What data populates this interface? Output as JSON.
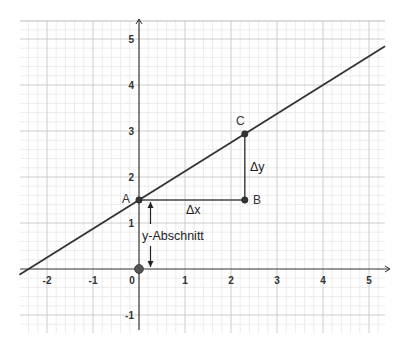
{
  "chart_data": {
    "type": "line",
    "title": "",
    "xlabel": "",
    "ylabel": "",
    "xlim": [
      -2.6,
      5.35
    ],
    "ylim": [
      -1.4,
      5.4
    ],
    "grid": true,
    "minor_grid_divisions": 5,
    "x_ticks": [
      -2,
      -1,
      0,
      1,
      2,
      3,
      4,
      5
    ],
    "y_ticks": [
      -1,
      1,
      2,
      3,
      4,
      5
    ],
    "x_tick_labels": [
      "-2",
      "-1",
      "0",
      "1",
      "2",
      "3",
      "4",
      "5"
    ],
    "y_tick_labels": [
      "-1",
      "1",
      "2",
      "3",
      "4",
      "5"
    ],
    "line": {
      "slope": 0.625,
      "intercept": 1.5,
      "color": "#333333"
    },
    "points": [
      {
        "name": "A",
        "x": 0,
        "y": 1.5
      },
      {
        "name": "B",
        "x": 2.3,
        "y": 1.5
      },
      {
        "name": "C",
        "x": 2.3,
        "y": 2.9375
      },
      {
        "name": "",
        "x": 0,
        "y": 0
      }
    ],
    "segments": [
      {
        "from": "A",
        "to": "B",
        "label": "Δx"
      },
      {
        "from": "B",
        "to": "C",
        "label": "Δy"
      }
    ],
    "annotations": [
      {
        "text": "y-Abschnitt",
        "type": "double-arrow",
        "from": [
          0.25,
          0
        ],
        "to": [
          0.25,
          1.5
        ]
      }
    ],
    "colors": {
      "axis": "#333333",
      "major_grid": "#cccccc",
      "minor_grid": "#ececec",
      "point": "#333333",
      "origin_point": "#555555"
    }
  },
  "labels": {
    "A": "A",
    "B": "B",
    "C": "C",
    "dx": "Δx",
    "dy": "Δy",
    "y_intercept": "y-Abschnitt"
  }
}
